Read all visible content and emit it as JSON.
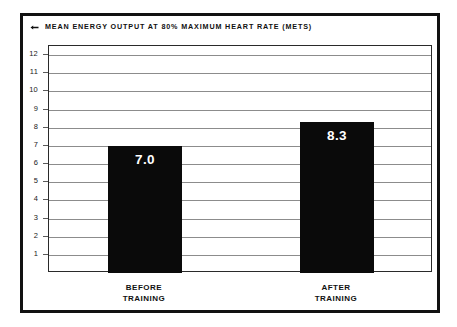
{
  "chart_data": {
    "type": "bar",
    "title": "MEAN ENERGY OUTPUT AT 80% MAXIMUM HEART RATE (METS)",
    "title_marker": "diamond-bullet-icon",
    "categories": [
      "BEFORE TRAINING",
      "AFTER TRAINING"
    ],
    "category_lines": [
      [
        "BEFORE",
        "TRAINING"
      ],
      [
        "AFTER",
        "TRAINING"
      ]
    ],
    "values": [
      7.0,
      8.3
    ],
    "value_labels": [
      "7.0",
      "8.3"
    ],
    "xlabel": "",
    "ylabel": "",
    "ylim": [
      0,
      12.5
    ],
    "yticks": [
      12,
      11,
      10,
      9,
      8,
      7,
      6,
      5,
      4,
      3,
      2,
      1
    ],
    "ytick_labels": [
      "12",
      "11",
      "10",
      "9",
      "8",
      "7",
      "6",
      "5",
      "4",
      "3",
      "2",
      "1"
    ],
    "grid": true,
    "legend": "none",
    "colors": {
      "bar_fill": "#0a0a0a",
      "value_text": "#ffffff",
      "gridline": "#8c8c8c",
      "frame": "#2a2a2a",
      "outer_border": "#111111",
      "background": "#ffffff",
      "text": "#111111"
    }
  }
}
